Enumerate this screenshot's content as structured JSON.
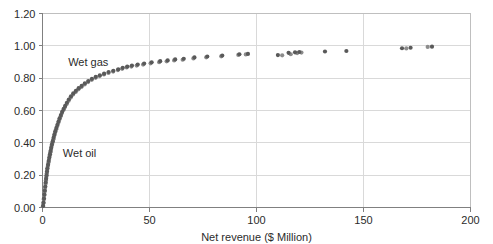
{
  "chart_data": {
    "type": "scatter",
    "title": "",
    "xlabel": "Net revenue ($ Million)",
    "ylabel": "",
    "xlim": [
      0,
      200
    ],
    "ylim": [
      0.0,
      1.2
    ],
    "xticks": [
      0,
      50,
      100,
      150,
      200
    ],
    "xtick_labels": [
      "0",
      "50",
      "100",
      "150",
      "200"
    ],
    "yticks": [
      0.0,
      0.2,
      0.4,
      0.6,
      0.8,
      1.0,
      1.2
    ],
    "ytick_labels": [
      "0.00",
      "0.20",
      "0.40",
      "0.60",
      "0.80",
      "1.00",
      "1.20"
    ],
    "grid": "horizontal-and-vertical",
    "legend": "inline-annotations",
    "annotations": [
      {
        "text": "Wet gas",
        "x": 12.0,
        "y": 0.9
      },
      {
        "text": "Wet oil",
        "x": 9.5,
        "y": 0.335
      }
    ],
    "series": [
      {
        "name": "Wet gas",
        "color": "#595959",
        "marker": "circle",
        "points": [
          [
            0.3,
            0.01
          ],
          [
            0.5,
            0.03
          ],
          [
            0.7,
            0.055
          ],
          [
            0.9,
            0.08
          ],
          [
            1.1,
            0.105
          ],
          [
            1.3,
            0.13
          ],
          [
            1.5,
            0.155
          ],
          [
            1.7,
            0.178
          ],
          [
            1.9,
            0.2
          ],
          [
            2.1,
            0.222
          ],
          [
            2.3,
            0.243
          ],
          [
            2.6,
            0.265
          ],
          [
            2.9,
            0.288
          ],
          [
            3.2,
            0.31
          ],
          [
            3.5,
            0.33
          ],
          [
            3.8,
            0.35
          ],
          [
            4.1,
            0.37
          ],
          [
            4.4,
            0.39
          ],
          [
            4.8,
            0.41
          ],
          [
            5.2,
            0.432
          ],
          [
            5.6,
            0.452
          ],
          [
            6.0,
            0.472
          ],
          [
            6.5,
            0.492
          ],
          [
            7.0,
            0.512
          ],
          [
            7.5,
            0.532
          ],
          [
            8.0,
            0.552
          ],
          [
            8.6,
            0.572
          ],
          [
            9.2,
            0.592
          ],
          [
            9.9,
            0.61
          ],
          [
            10.6,
            0.628
          ],
          [
            11.4,
            0.648
          ],
          [
            12.3,
            0.668
          ],
          [
            13.3,
            0.688
          ],
          [
            14.4,
            0.706
          ],
          [
            15.6,
            0.722
          ],
          [
            16.9,
            0.738
          ],
          [
            18.3,
            0.752
          ],
          [
            19.8,
            0.768
          ],
          [
            21.4,
            0.782
          ],
          [
            23.1,
            0.796
          ],
          [
            24.9,
            0.808
          ],
          [
            26.8,
            0.818
          ],
          [
            28.8,
            0.828
          ],
          [
            30.9,
            0.838
          ],
          [
            33.1,
            0.846
          ],
          [
            35.4,
            0.855
          ],
          [
            37.5,
            0.864
          ],
          [
            39.6,
            0.872
          ],
          [
            41.8,
            0.878
          ],
          [
            44.5,
            0.884
          ],
          [
            47.5,
            0.89
          ],
          [
            51.0,
            0.898
          ],
          [
            55.0,
            0.905
          ],
          [
            58.5,
            0.91
          ],
          [
            62.0,
            0.916
          ],
          [
            66.0,
            0.92
          ],
          [
            71.0,
            0.928
          ],
          [
            77.0,
            0.934
          ],
          [
            84.0,
            0.94
          ],
          [
            92.0,
            0.948
          ],
          [
            96.0,
            0.95
          ],
          [
            110.0,
            0.943
          ],
          [
            115.0,
            0.957
          ],
          [
            118.0,
            0.96
          ],
          [
            120.0,
            0.962
          ],
          [
            132.0,
            0.965
          ],
          [
            142.0,
            0.968
          ],
          [
            168.0,
            0.985
          ],
          [
            172.0,
            0.988
          ],
          [
            182.0,
            0.995
          ]
        ]
      },
      {
        "name": "Wet oil",
        "color": "#8c8c8c",
        "marker": "circle",
        "points": [
          [
            0.2,
            0.008
          ],
          [
            0.4,
            0.028
          ],
          [
            0.6,
            0.05
          ],
          [
            0.8,
            0.074
          ],
          [
            1.0,
            0.098
          ],
          [
            1.2,
            0.122
          ],
          [
            1.4,
            0.146
          ],
          [
            1.6,
            0.168
          ],
          [
            1.8,
            0.19
          ],
          [
            2.0,
            0.212
          ],
          [
            2.2,
            0.234
          ],
          [
            2.5,
            0.256
          ],
          [
            2.8,
            0.278
          ],
          [
            3.1,
            0.3
          ],
          [
            3.4,
            0.321
          ],
          [
            3.7,
            0.342
          ],
          [
            4.0,
            0.362
          ],
          [
            4.3,
            0.382
          ],
          [
            4.7,
            0.402
          ],
          [
            5.1,
            0.422
          ],
          [
            5.5,
            0.444
          ],
          [
            5.9,
            0.464
          ],
          [
            6.4,
            0.484
          ],
          [
            6.9,
            0.504
          ],
          [
            7.4,
            0.524
          ],
          [
            7.9,
            0.544
          ],
          [
            8.5,
            0.564
          ],
          [
            9.1,
            0.584
          ],
          [
            9.8,
            0.603
          ],
          [
            10.5,
            0.621
          ],
          [
            11.3,
            0.64
          ],
          [
            12.2,
            0.66
          ],
          [
            13.2,
            0.68
          ],
          [
            14.3,
            0.699
          ],
          [
            15.5,
            0.715
          ],
          [
            16.8,
            0.731
          ],
          [
            18.2,
            0.746
          ],
          [
            19.7,
            0.761
          ],
          [
            21.3,
            0.776
          ],
          [
            23.0,
            0.79
          ],
          [
            24.8,
            0.802
          ],
          [
            26.7,
            0.813
          ],
          [
            28.7,
            0.823
          ],
          [
            30.8,
            0.832
          ],
          [
            33.0,
            0.841
          ],
          [
            35.2,
            0.85
          ],
          [
            37.2,
            0.858
          ],
          [
            39.3,
            0.866
          ],
          [
            41.5,
            0.872
          ],
          [
            44.0,
            0.878
          ],
          [
            47.0,
            0.884
          ],
          [
            50.5,
            0.892
          ],
          [
            54.5,
            0.899
          ],
          [
            58.0,
            0.904
          ],
          [
            61.5,
            0.91
          ],
          [
            65.5,
            0.914
          ],
          [
            70.5,
            0.922
          ],
          [
            76.5,
            0.929
          ],
          [
            83.5,
            0.935
          ],
          [
            91.5,
            0.944
          ],
          [
            95.0,
            0.947
          ],
          [
            112.0,
            0.941
          ],
          [
            116.0,
            0.948
          ],
          [
            119.0,
            0.955
          ],
          [
            121.0,
            0.958
          ],
          [
            170.0,
            0.984
          ],
          [
            180.0,
            0.993
          ]
        ]
      }
    ]
  },
  "axes": {
    "x_axis_title": "Net revenue ($ Million)"
  }
}
